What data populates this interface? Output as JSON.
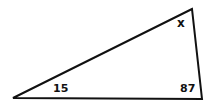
{
  "diagram": {
    "type": "triangle",
    "vertices": {
      "top": [
        192,
        9
      ],
      "bottom_left": [
        13,
        98
      ],
      "bottom_right": [
        202,
        99
      ]
    },
    "stroke_color": "#111111",
    "angles": [
      {
        "id": "top",
        "label": "x"
      },
      {
        "id": "bottom_left",
        "label": "15"
      },
      {
        "id": "bottom_right",
        "label": "87"
      }
    ]
  }
}
